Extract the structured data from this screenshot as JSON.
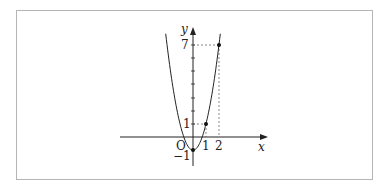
{
  "chart_data": {
    "type": "line",
    "title": "",
    "function": "y = 2x^2 - 1",
    "xlabel": "x",
    "ylabel": "y",
    "origin_label": "O",
    "x_ticks": [
      "1",
      "2"
    ],
    "y_ticks": [
      "-1",
      "1",
      "7"
    ],
    "points": [
      {
        "x": 0,
        "y": -1
      },
      {
        "x": 1,
        "y": 1
      },
      {
        "x": 2,
        "y": 7
      }
    ],
    "xlim": [
      -5.6,
      5.7
    ],
    "ylim": [
      -2.5,
      7.8
    ],
    "grid": false,
    "dashed_guides": [
      {
        "from": [
          1,
          0
        ],
        "to": [
          1,
          1
        ]
      },
      {
        "from": [
          0,
          1
        ],
        "to": [
          1,
          1
        ]
      },
      {
        "from": [
          2,
          0
        ],
        "to": [
          2,
          7
        ]
      },
      {
        "from": [
          0,
          7
        ],
        "to": [
          2,
          7
        ]
      }
    ]
  },
  "labels": {
    "x": "x",
    "y": "y",
    "origin": "O",
    "t1": "1",
    "t2": "2",
    "ym1": "−1",
    "y1": "1",
    "y7": "7"
  }
}
